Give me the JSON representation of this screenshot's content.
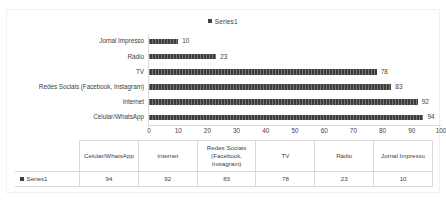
{
  "chart_data": {
    "type": "bar",
    "orientation": "horizontal",
    "title": "",
    "xlabel": "",
    "ylabel": "",
    "xlim": [
      0,
      100
    ],
    "xticks": [
      0,
      10,
      20,
      30,
      40,
      50,
      60,
      70,
      80,
      90,
      100
    ],
    "grid": false,
    "legend_position": "top",
    "series": [
      {
        "name": "Series1",
        "color": "#3d3d3d",
        "values": [
          10,
          23,
          78,
          83,
          92,
          94
        ]
      }
    ],
    "categories": [
      "Jornal Impresso",
      "Rádio",
      "TV",
      "Redes Sociais (Facebook, Instagram)",
      "Internet",
      "Celular/WhatsApp"
    ],
    "data_labels": [
      "10",
      "23",
      "78",
      "83",
      "92",
      "94"
    ]
  },
  "legend": {
    "marker_icon": "square-marker-icon",
    "entries": [
      {
        "label": "Series1",
        "color": "#3d3d3d"
      }
    ]
  },
  "axis": {
    "tick_labels": [
      "0",
      "10",
      "20",
      "30",
      "40",
      "50",
      "60",
      "70",
      "80",
      "90",
      "100"
    ]
  },
  "data_table": {
    "corner_label": "",
    "columns": [
      "Celular/WhatsApp",
      "Internet",
      "Redes Sociais (Facebook, Instagram)",
      "TV",
      "Rádio",
      "Jornal Impresso"
    ],
    "rows": [
      {
        "series_label": "Series1",
        "marker_icon": "square-marker-icon",
        "values": [
          "94",
          "92",
          "83",
          "78",
          "23",
          "10"
        ]
      }
    ]
  }
}
